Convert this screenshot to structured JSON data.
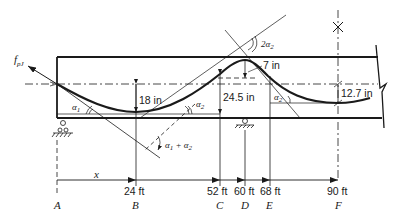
{
  "diagram": {
    "type": "prestressed beam tendon profile",
    "force_label": "f",
    "force_subscript": "pJ",
    "dimensions": {
      "sag_midspan": "18 in",
      "rise_at_D": "24.5 in",
      "top_offset": "7 in",
      "end_offset_F": "12.7 in"
    },
    "angles": {
      "alpha1": "α",
      "alpha1_sub": "1",
      "alpha2": "α",
      "alpha2_sub": "2",
      "alpha2_right": "α",
      "alpha2_right_sub": "2",
      "double_alpha2": "2α",
      "double_alpha2_sub": "2",
      "sum_alpha": "α",
      "sum_alpha_sub1": "1",
      "sum_alpha_plus": "+ α",
      "sum_alpha_sub2": "2"
    },
    "x_label": "x",
    "stations": [
      {
        "point": "A",
        "distance": ""
      },
      {
        "point": "B",
        "distance": "24 ft"
      },
      {
        "point": "C",
        "distance": "52 ft"
      },
      {
        "point": "D",
        "distance": "60 ft"
      },
      {
        "point": "E",
        "distance": "68 ft"
      },
      {
        "point": "F",
        "distance": "90 ft"
      }
    ]
  }
}
